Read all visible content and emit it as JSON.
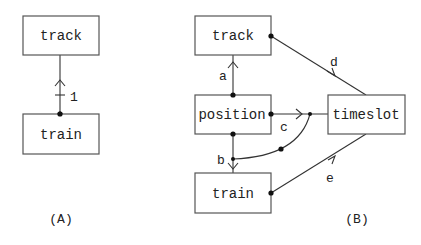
{
  "diagram_a": {
    "caption": "(A)",
    "nodes": {
      "track": "track",
      "train": "train"
    },
    "edges": [
      {
        "label": "1",
        "from": "train",
        "to": "track"
      }
    ]
  },
  "diagram_b": {
    "caption": "(B)",
    "nodes": {
      "track": "track",
      "position": "position",
      "train": "train",
      "timeslot": "timeslot"
    },
    "edges": [
      {
        "label": "a",
        "from": "position",
        "to": "track"
      },
      {
        "label": "b",
        "from": "position",
        "to": "train"
      },
      {
        "label": "c",
        "from": "position",
        "to": "timeslot"
      },
      {
        "label": "d",
        "from": "track",
        "to": "timeslot"
      },
      {
        "label": "e",
        "from": "train",
        "to": "timeslot"
      }
    ]
  }
}
